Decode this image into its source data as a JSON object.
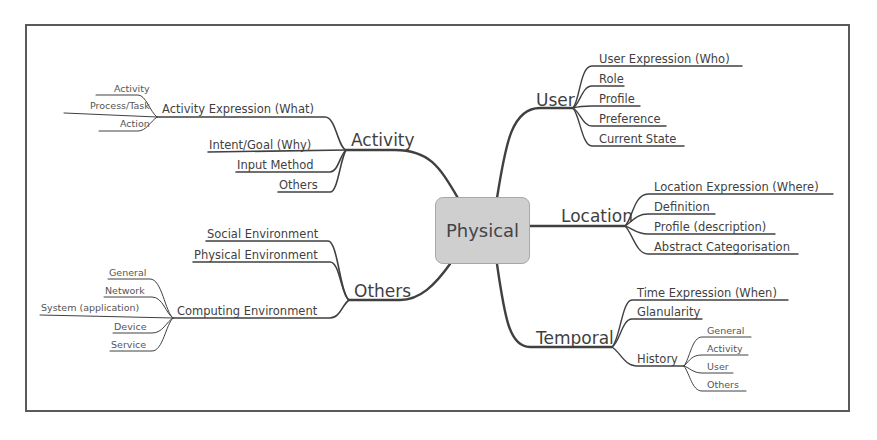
{
  "diagram": {
    "type": "mind-map",
    "center": {
      "label": "Physical",
      "fill": "#cfcfcf"
    },
    "branches": {
      "activity": {
        "label": "Activity",
        "children": [
          {
            "label": "Activity Expression (What)",
            "children": [
              "Activity",
              "Process/Task",
              "Action"
            ]
          },
          {
            "label": "Intent/Goal (Why)"
          },
          {
            "label": "Input Method"
          },
          {
            "label": "Others"
          }
        ]
      },
      "others": {
        "label": "Others",
        "children": [
          {
            "label": "Social Environment"
          },
          {
            "label": "Physical Environment"
          },
          {
            "label": "Computing Environment",
            "children": [
              "General",
              "Network",
              "System (application)",
              "Device",
              "Service"
            ]
          }
        ]
      },
      "user": {
        "label": "User",
        "children": [
          "User Expression (Who)",
          "Role",
          "Profile",
          "Preference",
          "Current State"
        ]
      },
      "location": {
        "label": "Location",
        "children": [
          "Location Expression (Where)",
          "Definition",
          "Profile (description)",
          "Abstract Categorisation"
        ]
      },
      "temporal": {
        "label": "Temporal",
        "children": [
          {
            "label": "Time Expression (When)"
          },
          {
            "label": "Glanularity"
          },
          {
            "label": "History",
            "children": [
              "General",
              "Activity",
              "User",
              "Others"
            ]
          }
        ]
      }
    },
    "colors": {
      "line": "#404040",
      "frame": "#5a5a5a",
      "text": "#3f3f3f"
    }
  }
}
